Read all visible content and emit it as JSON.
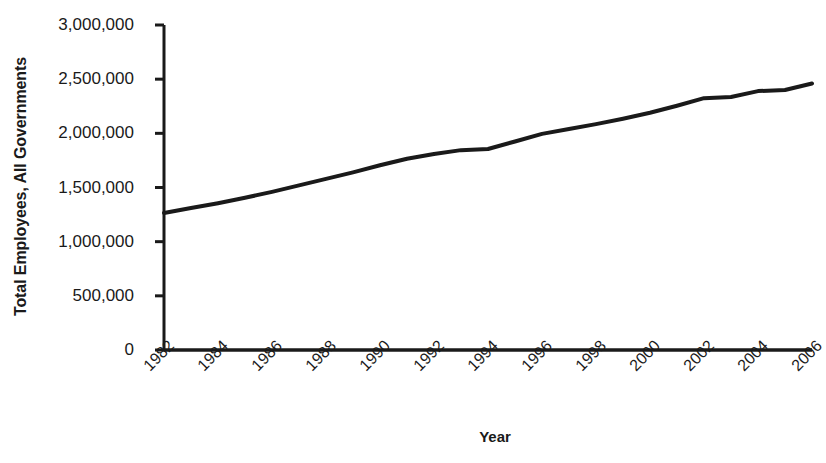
{
  "chart_data": {
    "type": "line",
    "title": "",
    "xlabel": "Year",
    "ylabel": "Total Employees, All Governments",
    "xlim": [
      1982,
      2006
    ],
    "ylim": [
      0,
      3000000
    ],
    "grid": false,
    "legend": false,
    "y_ticks": [
      0,
      500000,
      1000000,
      1500000,
      2000000,
      2500000,
      3000000
    ],
    "y_tick_labels": [
      "0",
      "500,000",
      "1,000,000",
      "1,500,000",
      "2,000,000",
      "2,500,000",
      "3,000,000"
    ],
    "x_ticks": [
      1982,
      1984,
      1986,
      1988,
      1990,
      1992,
      1994,
      1996,
      1998,
      2000,
      2002,
      2004,
      2006
    ],
    "x_tick_labels": [
      "1982",
      "1984",
      "1986",
      "1988",
      "1990",
      "1992",
      "1994",
      "1996",
      "1998",
      "2000",
      "2002",
      "2004",
      "2006"
    ],
    "x_tick_rotation": 45,
    "series": [
      {
        "name": "Total Employees, All Governments",
        "color": "#1a1a1a",
        "line_width": 4,
        "marker": "none",
        "x": [
          1982,
          1983,
          1984,
          1985,
          1986,
          1987,
          1988,
          1989,
          1990,
          1991,
          1992,
          1993,
          1994,
          1995,
          1996,
          1997,
          1998,
          1999,
          2000,
          2001,
          2002,
          2003,
          2004,
          2005,
          2006
        ],
        "values": [
          1265000,
          1310000,
          1355000,
          1405000,
          1460000,
          1520000,
          1580000,
          1640000,
          1705000,
          1765000,
          1810000,
          1845000,
          1855000,
          1925000,
          1995000,
          2040000,
          2085000,
          2135000,
          2190000,
          2255000,
          2325000,
          2335000,
          2390000,
          2400000,
          2460000
        ]
      }
    ]
  },
  "colors": {
    "axis": "#1a1a1a",
    "line": "#1a1a1a",
    "background": "#ffffff"
  }
}
